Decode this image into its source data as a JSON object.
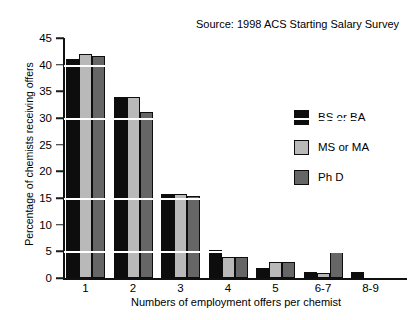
{
  "chart_data": {
    "type": "bar",
    "title": "",
    "subtitle": "",
    "xlabel": "Numbers of employment offers per chemist",
    "ylabel": "Percentage of chemists receiving offers",
    "categories": [
      "1",
      "2",
      "3",
      "4",
      "5",
      "6-7",
      "8-9"
    ],
    "series": [
      {
        "name": "BS or BA",
        "color": "#0d0d0d",
        "values": [
          41.0,
          34.0,
          15.8,
          5.3,
          1.8,
          1.2,
          1.2
        ]
      },
      {
        "name": "MS or MA",
        "color": "#b9b9b9",
        "values": [
          42.0,
          34.0,
          15.8,
          4.0,
          3.0,
          1.0,
          0.0
        ]
      },
      {
        "name": "Ph D",
        "color": "#666666",
        "values": [
          41.7,
          31.2,
          15.3,
          4.0,
          3.0,
          5.0,
          0.0
        ]
      }
    ],
    "ylim": [
      0,
      45
    ],
    "yticks": [
      0,
      5,
      10,
      15,
      20,
      25,
      30,
      35,
      40,
      45
    ],
    "ytick_labels": [
      "0",
      "5",
      "10",
      "15",
      "20",
      "25",
      "30",
      "35",
      "40",
      "45"
    ],
    "gridlines": [
      5,
      15,
      30,
      40
    ],
    "grid": "horizontal-white-overlay",
    "legend_position": "right",
    "annotations": [
      {
        "name": "source-note",
        "text": "Source: 1998 ACS Starting Salary Survey"
      }
    ]
  },
  "legend": {
    "items": [
      {
        "label": "BS or BA"
      },
      {
        "label": "MS or MA"
      },
      {
        "label": "Ph D"
      }
    ]
  }
}
